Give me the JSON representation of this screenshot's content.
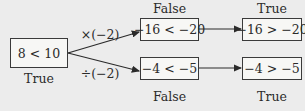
{
  "start": {
    "expression": "8 < 10",
    "truth": "True"
  },
  "branches": [
    {
      "operation": "×(−2)",
      "step1": {
        "expression": "−16 < −20",
        "truth": "False"
      },
      "step2": {
        "expression": "−16 > −20",
        "truth": "True"
      }
    },
    {
      "operation": "÷(−2)",
      "step1": {
        "expression": "−4 < −5",
        "truth": "False"
      },
      "step2": {
        "expression": "−4 > −5",
        "truth": "True"
      }
    }
  ],
  "colors": {
    "background": "#ececec",
    "box_fill": "#f7f7f5",
    "stroke": "#2a2a2a"
  }
}
